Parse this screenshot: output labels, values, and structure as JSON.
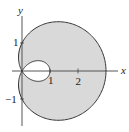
{
  "chart_data": {
    "type": "line",
    "title": "",
    "equation": "r = 1 + 2cos(θ)",
    "curve": "limaçon with inner loop",
    "xlabel": "x",
    "ylabel": "y",
    "x_ticks": [
      1,
      2
    ],
    "x_tick_labels": [
      "1",
      "2"
    ],
    "y_ticks": [
      1,
      -1
    ],
    "y_tick_labels": [
      "1",
      "−1"
    ],
    "xlim": [
      -0.3,
      3.6
    ],
    "ylim": [
      -2.2,
      2.5
    ],
    "grid": false,
    "legend": null,
    "fill": {
      "region": "between outer and inner loop",
      "color": "#d9d9d9"
    },
    "key_points": [
      {
        "label": "outer loop rightmost",
        "x": 3,
        "y": 0
      },
      {
        "label": "inner loop rightmost",
        "x": 1,
        "y": 0
      },
      {
        "label": "curve crosses y-axis",
        "x": 0,
        "y": 1
      },
      {
        "label": "curve crosses y-axis",
        "x": 0,
        "y": -1
      },
      {
        "label": "pole (self-intersection)",
        "x": 0,
        "y": 0
      }
    ]
  },
  "labels": {
    "x_axis": "x",
    "y_axis": "y",
    "x1": "1",
    "x2": "2",
    "y1": "1",
    "ym1": "−1"
  },
  "colors": {
    "fill": "#d9d9d9",
    "stroke": "#333333",
    "axis": "#444444"
  }
}
